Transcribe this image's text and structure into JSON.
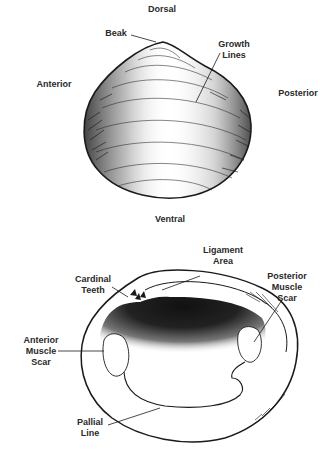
{
  "figure": {
    "external_view": {
      "orientation_labels": {
        "top": "Dorsal",
        "bottom": "Ventral",
        "left": "Anterior",
        "right": "Posterior"
      },
      "callouts": [
        {
          "id": "beak",
          "text": "Beak"
        },
        {
          "id": "growth-lines",
          "text": "Growth\nLines"
        }
      ]
    },
    "internal_view": {
      "callouts": [
        {
          "id": "ligament-area",
          "text": "Ligament\nArea"
        },
        {
          "id": "cardinal-teeth",
          "text": "Cardinal\nTeeth"
        },
        {
          "id": "posterior-muscle-scar",
          "text": "Posterior\nMuscle\nScar"
        },
        {
          "id": "anterior-muscle-scar",
          "text": "Anterior\nMuscle\nScar"
        },
        {
          "id": "pallial-line",
          "text": "Pallial\nLine"
        }
      ]
    },
    "colors": {
      "ink": "#1a1a1a",
      "background": "#ffffff"
    }
  }
}
